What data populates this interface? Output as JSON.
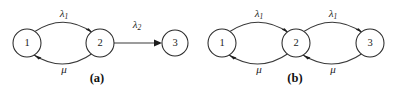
{
  "figure": {
    "background_color": "#ffffff",
    "stroke_color": "#3a3a3a",
    "text_color": "#1c1c1c",
    "panels": [
      {
        "id": "panel-a",
        "caption": "(a)",
        "caption_x": 97,
        "caption_y": 79,
        "nodes": [
          {
            "id": "a-node-1",
            "label": "1",
            "cx": 27,
            "cy": 43,
            "r": 14
          },
          {
            "id": "a-node-2",
            "label": "2",
            "cx": 100,
            "cy": 43,
            "r": 14
          },
          {
            "id": "a-node-3",
            "label": "3",
            "cx": 175,
            "cy": 43,
            "r": 13
          }
        ],
        "edges": [
          {
            "id": "a-edge-1-2-forward",
            "from": "1",
            "to": "2",
            "shape": "arc-up",
            "label": "λ",
            "label_sub": "1",
            "label_x": 64,
            "label_y": 14
          },
          {
            "id": "a-edge-2-1-return",
            "from": "2",
            "to": "1",
            "shape": "arc-down",
            "label": "μ",
            "label_sub": "",
            "label_x": 64,
            "label_y": 70
          },
          {
            "id": "a-edge-2-3-forward",
            "from": "2",
            "to": "3",
            "shape": "straight",
            "label": "λ",
            "label_sub": "2",
            "label_x": 137,
            "label_y": 25
          }
        ]
      },
      {
        "id": "panel-b",
        "caption": "(b)",
        "caption_x": 295,
        "caption_y": 79,
        "nodes": [
          {
            "id": "b-node-1",
            "label": "1",
            "cx": 222,
            "cy": 43,
            "r": 14
          },
          {
            "id": "b-node-2",
            "label": "2",
            "cx": 296,
            "cy": 43,
            "r": 14
          },
          {
            "id": "b-node-3",
            "label": "3",
            "cx": 370,
            "cy": 43,
            "r": 14
          }
        ],
        "edges": [
          {
            "id": "b-edge-1-2-forward",
            "from": "1",
            "to": "2",
            "shape": "arc-up",
            "label": "λ",
            "label_sub": "1",
            "label_x": 259,
            "label_y": 14
          },
          {
            "id": "b-edge-2-1-return",
            "from": "2",
            "to": "1",
            "shape": "arc-down",
            "label": "μ",
            "label_sub": "",
            "label_x": 259,
            "label_y": 70
          },
          {
            "id": "b-edge-2-3-forward",
            "from": "2",
            "to": "3",
            "shape": "arc-up",
            "label": "λ",
            "label_sub": "1",
            "label_x": 333,
            "label_y": 14
          },
          {
            "id": "b-edge-3-2-return",
            "from": "3",
            "to": "2",
            "shape": "arc-down",
            "label": "μ",
            "label_sub": "",
            "label_x": 333,
            "label_y": 70
          }
        ]
      }
    ]
  }
}
